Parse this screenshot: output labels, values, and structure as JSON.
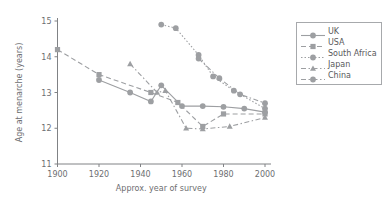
{
  "chart_data": {
    "type": "line",
    "title": "",
    "xlabel": "Approx. year of survey",
    "ylabel": "Age at menarche (years)",
    "xlim": [
      1900,
      2000
    ],
    "ylim": [
      11,
      15
    ],
    "xticks": [
      1900,
      1920,
      1940,
      1960,
      1980,
      2000
    ],
    "yticks": [
      11,
      12,
      13,
      14,
      15
    ],
    "grid": false,
    "legend_position": "right-outside",
    "series": [
      {
        "name": "UK",
        "marker": "circle",
        "dash": "solid",
        "color": "#9d9fa2",
        "points": [
          [
            1920,
            13.35
          ],
          [
            1935,
            13.0
          ],
          [
            1945,
            12.75
          ],
          [
            1950,
            13.2
          ],
          [
            1960,
            12.62
          ],
          [
            1970,
            12.62
          ],
          [
            1980,
            12.6
          ],
          [
            1990,
            12.55
          ],
          [
            2000,
            12.45
          ]
        ]
      },
      {
        "name": "USA",
        "marker": "square",
        "dash": "dashed",
        "color": "#9d9fa2",
        "points": [
          [
            1900,
            14.2
          ],
          [
            1920,
            13.5
          ],
          [
            1945,
            13.0
          ],
          [
            1958,
            12.72
          ],
          [
            1970,
            12.05
          ],
          [
            1980,
            12.4
          ],
          [
            2000,
            12.4
          ]
        ]
      },
      {
        "name": "South Africa",
        "marker": "circle",
        "dash": "dotted",
        "color": "#9d9fa2",
        "points": [
          [
            1950,
            14.9
          ],
          [
            1957,
            14.8
          ],
          [
            1968,
            14.05
          ],
          [
            1975,
            13.45
          ],
          [
            1985,
            13.05
          ],
          [
            2000,
            12.55
          ]
        ]
      },
      {
        "name": "Japan",
        "marker": "triangle",
        "dash": "dashdot",
        "color": "#9d9fa2",
        "points": [
          [
            1935,
            13.8
          ],
          [
            1948,
            13.0
          ],
          [
            1952,
            13.05
          ],
          [
            1962,
            12.0
          ],
          [
            1970,
            11.98
          ],
          [
            1983,
            12.05
          ],
          [
            2000,
            12.3
          ]
        ]
      },
      {
        "name": "China",
        "marker": "circle",
        "dash": "dashdot",
        "color": "#9d9fa2",
        "points": [
          [
            1968,
            13.95
          ],
          [
            1978,
            13.4
          ],
          [
            1988,
            12.95
          ],
          [
            2000,
            12.7
          ]
        ]
      }
    ]
  },
  "legend": {
    "items": [
      {
        "label": "UK",
        "marker": "circle",
        "dash": "solid"
      },
      {
        "label": "USA",
        "marker": "square",
        "dash": "dashed"
      },
      {
        "label": "South Africa",
        "marker": "circle",
        "dash": "dotted"
      },
      {
        "label": "Japan",
        "marker": "triangle",
        "dash": "dashdot"
      },
      {
        "label": "China",
        "marker": "circle",
        "dash": "dashdot"
      }
    ]
  }
}
